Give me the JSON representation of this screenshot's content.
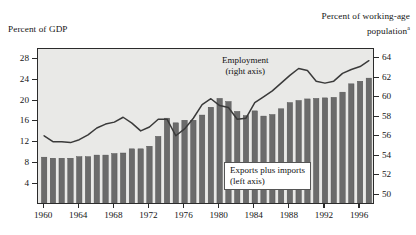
{
  "figure": {
    "left_axis_title": "Percent of GDP",
    "right_axis_title_line1": "Percent of working-age",
    "right_axis_title_line2": "population",
    "right_axis_title_superscript": "a",
    "plot_background": "#e9e9e7",
    "bar_color": "#6b6b6b",
    "line_color": "#3a3a3a"
  },
  "legend": {
    "exports_line1": "Exports plus imports",
    "exports_line2": "(left axis)",
    "employment_line1": "Employment",
    "employment_line2": "(right axis)"
  },
  "chart_data": {
    "type": "bar",
    "title": "",
    "subtitle": "",
    "xlabel": "",
    "ylabel": "Percent of GDP",
    "y2label": "Percent of working-age population",
    "grid": false,
    "legend_position": "inside",
    "xlim": [
      1959.3,
      1997.7
    ],
    "ylim": [
      0,
      30
    ],
    "y2lim": [
      49,
      65
    ],
    "xticks": [
      1960,
      1964,
      1968,
      1972,
      1976,
      1980,
      1984,
      1988,
      1992,
      1996
    ],
    "yticks": [
      4,
      8,
      12,
      16,
      20,
      24,
      28
    ],
    "y2ticks": [
      50,
      52,
      54,
      56,
      58,
      60,
      62,
      64
    ],
    "x": [
      1960,
      1961,
      1962,
      1963,
      1964,
      1965,
      1966,
      1967,
      1968,
      1969,
      1970,
      1971,
      1972,
      1973,
      1974,
      1975,
      1976,
      1977,
      1978,
      1979,
      1980,
      1981,
      1982,
      1983,
      1984,
      1985,
      1986,
      1987,
      1988,
      1989,
      1990,
      1991,
      1992,
      1993,
      1994,
      1995,
      1996,
      1997
    ],
    "series": [
      {
        "name": "Exports plus imports",
        "type": "bar",
        "axis": "left",
        "unit": "Percent of GDP",
        "color": "#6b6b6b",
        "values": [
          9.2,
          9.0,
          9.0,
          9.0,
          9.3,
          9.3,
          9.6,
          9.6,
          9.9,
          10.0,
          10.8,
          10.8,
          11.3,
          13.2,
          16.7,
          15.8,
          16.3,
          16.3,
          17.3,
          18.8,
          20.5,
          19.9,
          18.0,
          17.2,
          18.1,
          17.1,
          17.4,
          18.5,
          19.7,
          20.1,
          20.4,
          20.5,
          20.6,
          20.7,
          21.7,
          23.3,
          23.8,
          24.4
        ]
      },
      {
        "name": "Employment",
        "type": "line",
        "axis": "right",
        "unit": "Percent of working-age population",
        "color": "#3a3a3a",
        "values": [
          56.1,
          55.5,
          55.5,
          55.4,
          55.7,
          56.2,
          56.9,
          57.3,
          57.5,
          58.0,
          57.4,
          56.6,
          57.0,
          57.8,
          57.8,
          56.1,
          56.8,
          57.9,
          59.3,
          59.9,
          59.2,
          59.0,
          57.8,
          57.9,
          59.5,
          60.1,
          60.7,
          61.5,
          62.3,
          63.0,
          62.8,
          61.7,
          61.5,
          61.7,
          62.5,
          62.9,
          63.2,
          63.8
        ]
      }
    ]
  }
}
